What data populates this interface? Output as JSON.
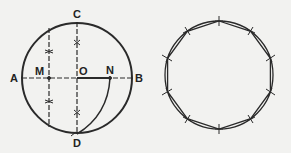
{
  "figure_left": {
    "description": "Construction of a regular decagon side within a circle",
    "labels": {
      "A": "A",
      "B": "B",
      "C": "C",
      "D": "D",
      "M": "M",
      "O": "O",
      "N": "N"
    }
  },
  "figure_right": {
    "description": "Regular decagon inscribed in circle with tick marks at vertices",
    "vertex_count": 10
  },
  "colors": {
    "line": "#2a2a2a",
    "background": "#f2f2f0"
  }
}
